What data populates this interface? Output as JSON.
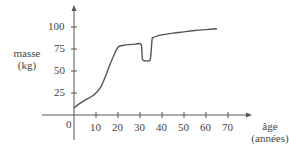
{
  "chart_data": {
    "type": "line",
    "title": "",
    "xlabel": "âge (années)",
    "ylabel": "masse (kg)",
    "xlabel_lines": [
      "âge",
      "(années)"
    ],
    "ylabel_lines": [
      "masse",
      "(kg)"
    ],
    "x_ticks": [
      "10",
      "20",
      "30",
      "40",
      "50",
      "60",
      "70"
    ],
    "y_ticks": [
      "25",
      "50",
      "75",
      "100"
    ],
    "origin_label": "0",
    "xlim": [
      0,
      75
    ],
    "ylim": [
      0,
      110
    ],
    "grid": false,
    "legend": null,
    "series": [
      {
        "name": "masse",
        "x": [
          0,
          2,
          5,
          8,
          10,
          12,
          14,
          16,
          18,
          20,
          22,
          25,
          28,
          30.5,
          31,
          31.5,
          33,
          34.5,
          35,
          35.5,
          36,
          38,
          40,
          45,
          50,
          55,
          60,
          65
        ],
        "y": [
          8,
          12,
          17,
          21,
          25,
          31,
          42,
          55,
          67,
          77,
          79,
          80,
          80.5,
          80,
          65,
          62,
          61.5,
          62,
          70,
          86,
          88,
          90,
          91,
          93,
          94.5,
          96,
          97,
          98
        ]
      }
    ]
  },
  "colors": {
    "axis": "#555555",
    "curve": "#555555"
  }
}
